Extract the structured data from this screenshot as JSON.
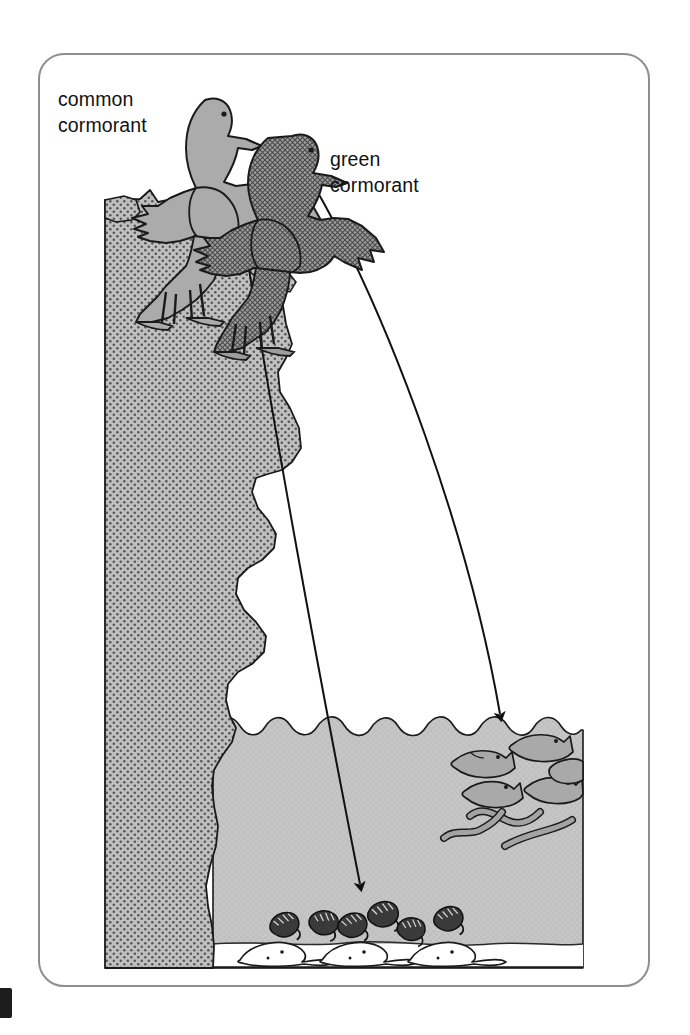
{
  "figure": {
    "frame": {
      "shape": "rounded-rectangle",
      "border_color": "#8e8e8e"
    }
  },
  "labels": {
    "common_cormorant": "common\ncormorant",
    "green_cormorant": "green\ncormorant"
  },
  "species": [
    {
      "id": "common-cormorant",
      "name": "common cormorant",
      "fill": "#a8a8a8",
      "texture": "solid-light-grey",
      "pose": "wings spread, perched on cliff top",
      "feeds_on": [
        "shrimp",
        "flatfish"
      ],
      "feeding_zone": "sea bed"
    },
    {
      "id": "green-cormorant",
      "name": "green cormorant",
      "fill": "#8f8f8f",
      "texture": "cross-hatch-dark-grey",
      "pose": "wings spread, perched lower on cliff",
      "feeds_on": [
        "fish",
        "eels"
      ],
      "feeding_zone": "mid water / near surface"
    }
  ],
  "arrows": [
    {
      "id": "arrow-common-cormorant",
      "from": "common cormorant",
      "to": "sea bed",
      "target_prey": "shrimp and flatfish",
      "style": "thin curved line with solid arrowhead"
    },
    {
      "id": "arrow-green-cormorant",
      "from": "green cormorant",
      "to": "upper water layer",
      "target_prey": "fish and eels",
      "style": "thin curved line with solid arrowhead"
    }
  ],
  "environment": {
    "cliff": {
      "name": "sea cliff",
      "fill": "#b4b4b4",
      "texture": "stippled dots",
      "edge": "jagged stepped profile"
    },
    "water": {
      "name": "sea water",
      "fill": "#c2c2c2",
      "surface": "scalloped wave line"
    },
    "seabed": {
      "name": "sea bed",
      "fill": "#ffffff"
    }
  },
  "prey": {
    "fish": {
      "label": "fish",
      "count": 5,
      "zone": "upper water"
    },
    "eels": {
      "label": "eels",
      "count": 3,
      "zone": "mid water"
    },
    "shrimp": {
      "label": "shrimp",
      "count": 6,
      "zone": "sea bed"
    },
    "flatfish": {
      "label": "flatfish",
      "count": 3,
      "zone": "sea bed"
    }
  },
  "colors": {
    "frame": "#8e8e8e",
    "cliff": "#b4b4b4",
    "water": "#c2c2c2",
    "bird_light": "#a8a8a8",
    "bird_dark": "#8f8f8f",
    "outline": "#1a1a1a",
    "text": "#111111"
  }
}
